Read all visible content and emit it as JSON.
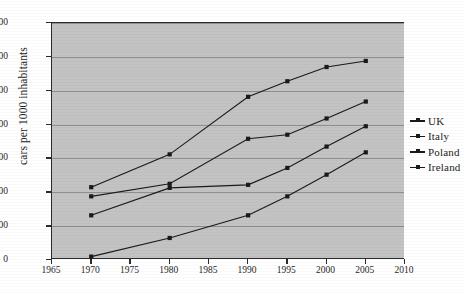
{
  "chart_data": {
    "type": "line",
    "title": "",
    "xlabel": "",
    "ylabel": "cars per 1000 inhabitants",
    "xlim": [
      1965,
      2010
    ],
    "ylim": [
      0,
      700
    ],
    "grid": true,
    "legend_position": "right",
    "x": [
      1970,
      1980,
      1990,
      1995,
      2000,
      2005
    ],
    "xticks": [
      "1965",
      "1970",
      "1975",
      "1980",
      "1985",
      "1990",
      "1995",
      "2000",
      "2005",
      "2010"
    ],
    "xtick_values": [
      1965,
      1970,
      1975,
      1980,
      1985,
      1990,
      1995,
      2000,
      2005,
      2010
    ],
    "yticks": [
      "0",
      "100",
      "200",
      "300",
      "400",
      "500",
      "600",
      "700"
    ],
    "ytick_values": [
      0,
      100,
      200,
      300,
      400,
      500,
      600,
      700
    ],
    "series": [
      {
        "name": "UK",
        "marker": "square",
        "color": "#1a1a1a",
        "values": [
          215,
          312,
          482,
          528,
          570,
          588
        ]
      },
      {
        "name": "Italy",
        "marker": "square",
        "color": "#1a1a1a",
        "values": [
          188,
          225,
          358,
          370,
          418,
          468
        ]
      },
      {
        "name": "Poland",
        "marker": "square",
        "color": "#1a1a1a",
        "values": [
          132,
          213,
          222,
          272,
          335,
          395
        ]
      },
      {
        "name": "Ireland",
        "marker": "square",
        "color": "#1a1a1a",
        "values": [
          10,
          65,
          132,
          188,
          252,
          318
        ]
      }
    ]
  },
  "legend": {
    "entries": [
      {
        "label": "UK"
      },
      {
        "label": "Italy"
      },
      {
        "label": "Poland"
      },
      {
        "label": "Ireland"
      }
    ]
  },
  "colors": {
    "plot_background": "#c3c3c3",
    "axis": "#2b2b2b",
    "gridline": "#8e8e8e",
    "line": "#1a1a1a",
    "page_background": "#ffffff"
  }
}
